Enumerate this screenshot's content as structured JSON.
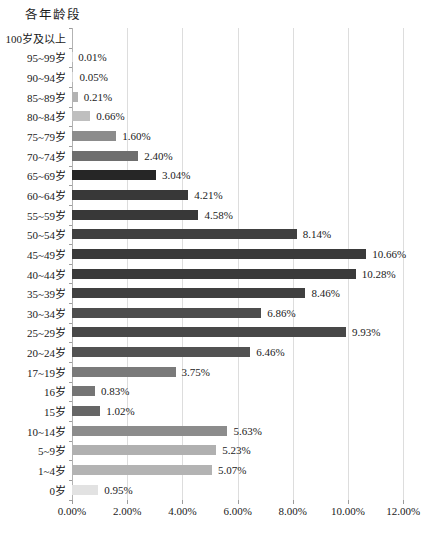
{
  "chart_data": {
    "type": "bar",
    "orientation": "horizontal",
    "title": "各年龄段",
    "xlabel": "",
    "ylabel": "各年龄段",
    "xlim": [
      0,
      12
    ],
    "grid": "vertical",
    "legend": "none",
    "x_tick_values": [
      0,
      2,
      4,
      6,
      8,
      10,
      12
    ],
    "x_tick_labels": [
      "0.00%",
      "2.00%",
      "4.00%",
      "6.00%",
      "8.00%",
      "10.00%",
      "12.00%"
    ],
    "categories": [
      "100岁及以上",
      "95~99岁",
      "90~94岁",
      "85~89岁",
      "80~84岁",
      "75~79岁",
      "70~74岁",
      "65~69岁",
      "60~64岁",
      "55~59岁",
      "50~54岁",
      "45~49岁",
      "40~44岁",
      "35~39岁",
      "30~34岁",
      "25~29岁",
      "20~24岁",
      "17~19岁",
      "16岁",
      "15岁",
      "10~14岁",
      "5~9岁",
      "1~4岁",
      "0岁"
    ],
    "values": [
      0,
      0.01,
      0.05,
      0.21,
      0.66,
      1.6,
      2.4,
      3.04,
      4.21,
      4.58,
      8.14,
      10.66,
      10.28,
      8.46,
      6.86,
      9.93,
      6.46,
      3.75,
      0.83,
      1.02,
      5.63,
      5.23,
      5.07,
      0.95
    ],
    "data_labels": [
      "",
      "0.01%",
      "0.05%",
      "0.21%",
      "0.66%",
      "1.60%",
      "2.40%",
      "3.04%",
      "4.21%",
      "4.58%",
      "8.14%",
      "10.66%",
      "10.28%",
      "8.46%",
      "6.86%",
      "9.93%",
      "6.46%",
      "3.75%",
      "0.83%",
      "1.02%",
      "5.63%",
      "5.23%",
      "5.07%",
      "0.95%"
    ],
    "bar_colors": [
      "#ffffff",
      "#d9d9d9",
      "#d9d9d9",
      "#b3b3b3",
      "#bfbfbf",
      "#8c8c8c",
      "#6e6e6e",
      "#262626",
      "#383838",
      "#383838",
      "#404040",
      "#3a3a3a",
      "#3a3a3a",
      "#404040",
      "#4d4d4d",
      "#484848",
      "#525252",
      "#7a7a7a",
      "#757575",
      "#666666",
      "#8c8c8c",
      "#b0b0b0",
      "#b3b3b3",
      "#e2e2e2"
    ],
    "colors": {
      "axis": "#b3b3b3",
      "gridline": "#dddddd",
      "tick": "#9c9c9c",
      "text": "#1a1a1a",
      "background": "#ffffff"
    }
  }
}
